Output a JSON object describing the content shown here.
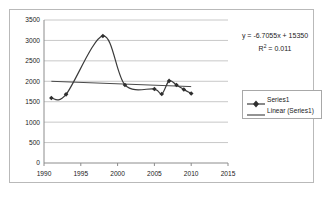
{
  "chart_data": {
    "type": "line",
    "title": "",
    "xlabel": "",
    "ylabel": "",
    "xlim": [
      1990,
      2015
    ],
    "ylim": [
      0,
      3500
    ],
    "grid": true,
    "legend_position": "right",
    "x_ticks": [
      "1990",
      "1995",
      "2000",
      "2005",
      "2010",
      "2015"
    ],
    "x_tick_values": [
      1990,
      1995,
      2000,
      2005,
      2010,
      2015
    ],
    "y_ticks": [
      "0",
      "500",
      "1000",
      "1500",
      "2000",
      "2500",
      "3000",
      "3500"
    ],
    "y_tick_values": [
      0,
      500,
      1000,
      1500,
      2000,
      2500,
      3000,
      3500
    ],
    "series": [
      {
        "name": "Series1",
        "marker": "diamond",
        "color": "#3a3a3a",
        "x": [
          1991,
          1993,
          1998,
          2001,
          2005,
          2006,
          2007,
          2008,
          2009,
          2010
        ],
        "values": [
          1590,
          1680,
          3110,
          1910,
          1810,
          1690,
          2010,
          1910,
          1800,
          1700
        ]
      },
      {
        "name": "Linear (Series1)",
        "marker": "none",
        "color": "#4a4a4a",
        "x": [
          1991,
          2010
        ],
        "values": [
          2000,
          1870
        ]
      }
    ],
    "annotations": [
      {
        "text": "y = -6.7055x + 15350"
      },
      {
        "text_prefix": "R",
        "text_sup": "2",
        "text_suffix": " = 0.011"
      }
    ],
    "trendline": {
      "equation": "y = -6.7055x + 15350",
      "slope": -6.7055,
      "intercept": 15350,
      "r_squared": 0.011,
      "r_squared_label": "R² = 0.011"
    },
    "legend_entries": [
      {
        "label": "Series1",
        "style": "line-with-marker"
      },
      {
        "label": "Linear (Series1)",
        "style": "line"
      }
    ]
  },
  "colors": {
    "series_line": "#3a3a3a",
    "trend_line": "#4a4a4a",
    "grid": "#c8c8c8",
    "axis": "#8c8c8c",
    "frame_border": "#b9b9b9",
    "legend_border": "#a8a8a8",
    "text": "#1a1a1a",
    "background": "#ffffff"
  }
}
